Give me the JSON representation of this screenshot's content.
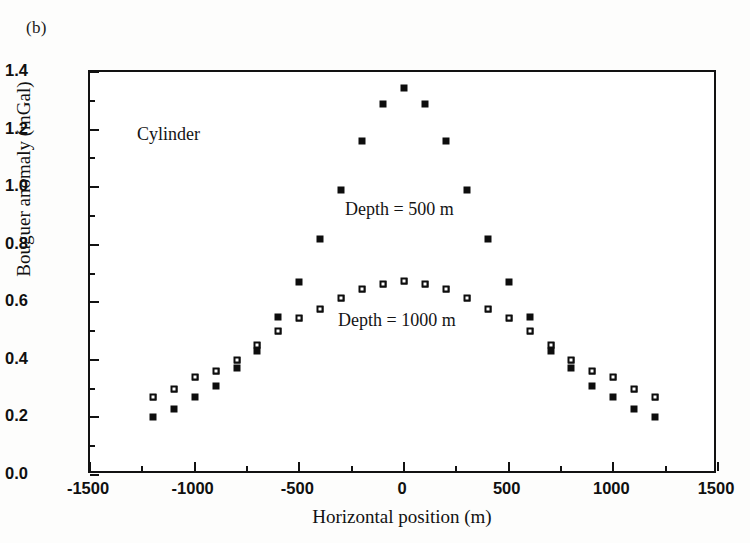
{
  "figure": {
    "panel_label": "(b)"
  },
  "annotations": {
    "cylinder": "Cylinder",
    "depth_500": "Depth = 500 m",
    "depth_1000": "Depth = 1000 m"
  },
  "axes": {
    "x_title": "Horizontal position (m)",
    "y_title": "Bouguer anomaly (mGal)",
    "x_ticks": [
      "-1500",
      "-1000",
      "-500",
      "0",
      "500",
      "1000",
      "1500"
    ],
    "y_ticks": [
      "0.0",
      "0.2",
      "0.4",
      "0.6",
      "0.8",
      "1.0",
      "1.2",
      "1.4"
    ]
  },
  "style": {
    "marker_color": "#0d0d0d",
    "frame_color": "#121212",
    "background": "#ffffff"
  },
  "chart_data": {
    "type": "scatter",
    "title": "",
    "panel": "(b)",
    "xlabel": "Horizontal position (m)",
    "ylabel": "Bouguer anomaly (mGal)",
    "xlim": [
      -1500,
      1500
    ],
    "ylim": [
      0.0,
      1.4
    ],
    "x_major_tick": 500,
    "x_minor_tick": 250,
    "y_major_tick": 0.2,
    "y_minor_tick": 0.1,
    "grid": false,
    "legend_position": "inline-annotation",
    "x": [
      -1200,
      -1100,
      -1000,
      -900,
      -800,
      -700,
      -600,
      -500,
      -400,
      -300,
      -200,
      -100,
      0,
      100,
      200,
      300,
      400,
      500,
      600,
      700,
      800,
      900,
      1000,
      1100,
      1200
    ],
    "series": [
      {
        "name": "Depth = 500 m",
        "marker": "filled-square",
        "label": "Depth = 500 m",
        "values": [
          0.2,
          0.23,
          0.27,
          0.31,
          0.37,
          0.43,
          0.55,
          0.67,
          0.82,
          0.99,
          1.16,
          1.29,
          1.345,
          1.29,
          1.16,
          0.99,
          0.82,
          0.67,
          0.55,
          0.43,
          0.37,
          0.31,
          0.27,
          0.23,
          0.2
        ]
      },
      {
        "name": "Depth = 1000 m",
        "marker": "open-square",
        "label": "Depth = 1000 m",
        "values": [
          0.27,
          0.3,
          0.34,
          0.36,
          0.4,
          0.45,
          0.5,
          0.545,
          0.575,
          0.615,
          0.645,
          0.665,
          0.675,
          0.665,
          0.645,
          0.615,
          0.575,
          0.545,
          0.5,
          0.45,
          0.4,
          0.36,
          0.34,
          0.3,
          0.27
        ]
      }
    ]
  }
}
